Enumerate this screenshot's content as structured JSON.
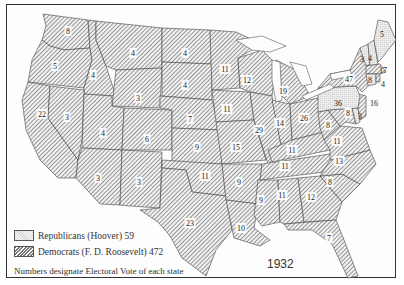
{
  "map": {
    "title_year": "1932",
    "note": "Numbers designate Electoral Vote of each state",
    "colors": {
      "republican_fill": "#e6e6e6",
      "democrat_hatch": "#777777",
      "border": "#333333",
      "background": "#ffffff"
    },
    "legend": [
      {
        "party": "Republican",
        "label": "Republicans (Hoover) 59",
        "pattern": "light-stipple"
      },
      {
        "party": "Democrat",
        "label": "Democrats (F. D. Roosevelt) 472",
        "pattern": "diagonal-hatch"
      }
    ],
    "states": [
      {
        "name": "Washington",
        "votes": "8",
        "party": "D"
      },
      {
        "name": "Oregon",
        "votes": "5",
        "party": "D"
      },
      {
        "name": "California",
        "votes": "22",
        "party": "D"
      },
      {
        "name": "Idaho",
        "votes": "4",
        "party": "D"
      },
      {
        "name": "Nevada",
        "votes": "3",
        "party": "D"
      },
      {
        "name": "Montana",
        "votes": "4",
        "party": "D"
      },
      {
        "name": "Wyoming",
        "votes": "3",
        "party": "D"
      },
      {
        "name": "Utah",
        "votes": "4",
        "party": "D"
      },
      {
        "name": "Arizona",
        "votes": "3",
        "party": "D"
      },
      {
        "name": "Colorado",
        "votes": "6",
        "party": "D"
      },
      {
        "name": "New Mexico",
        "votes": "3",
        "party": "D"
      },
      {
        "name": "North Dakota",
        "votes": "4",
        "party": "D"
      },
      {
        "name": "South Dakota",
        "votes": "4",
        "party": "D"
      },
      {
        "name": "Nebraska",
        "votes": "7",
        "party": "D"
      },
      {
        "name": "Kansas",
        "votes": "9",
        "party": "D"
      },
      {
        "name": "Oklahoma",
        "votes": "11",
        "party": "D"
      },
      {
        "name": "Texas",
        "votes": "23",
        "party": "D"
      },
      {
        "name": "Minnesota",
        "votes": "11",
        "party": "D"
      },
      {
        "name": "Iowa",
        "votes": "11",
        "party": "D"
      },
      {
        "name": "Missouri",
        "votes": "15",
        "party": "D"
      },
      {
        "name": "Arkansas",
        "votes": "9",
        "party": "D"
      },
      {
        "name": "Louisiana",
        "votes": "10",
        "party": "D"
      },
      {
        "name": "Wisconsin",
        "votes": "12",
        "party": "D"
      },
      {
        "name": "Illinois",
        "votes": "29",
        "party": "D"
      },
      {
        "name": "Michigan",
        "votes": "19",
        "party": "D"
      },
      {
        "name": "Indiana",
        "votes": "14",
        "party": "D"
      },
      {
        "name": "Ohio",
        "votes": "26",
        "party": "D"
      },
      {
        "name": "Kentucky",
        "votes": "11",
        "party": "D"
      },
      {
        "name": "Tennessee",
        "votes": "11",
        "party": "D"
      },
      {
        "name": "Mississippi",
        "votes": "9",
        "party": "D"
      },
      {
        "name": "Alabama",
        "votes": "11",
        "party": "D"
      },
      {
        "name": "Georgia",
        "votes": "12",
        "party": "D"
      },
      {
        "name": "Florida",
        "votes": "7",
        "party": "D"
      },
      {
        "name": "South Carolina",
        "votes": "8",
        "party": "D"
      },
      {
        "name": "North Carolina",
        "votes": "13",
        "party": "D"
      },
      {
        "name": "Virginia",
        "votes": "11",
        "party": "D"
      },
      {
        "name": "West Virginia",
        "votes": "8",
        "party": "D"
      },
      {
        "name": "Maryland",
        "votes": "8",
        "party": "D"
      },
      {
        "name": "Delaware",
        "votes": "3",
        "party": "R"
      },
      {
        "name": "New Jersey",
        "votes": "16",
        "party": "D"
      },
      {
        "name": "Pennsylvania",
        "votes": "36",
        "party": "R"
      },
      {
        "name": "New York",
        "votes": "47",
        "party": "D"
      },
      {
        "name": "Vermont",
        "votes": "3",
        "party": "R"
      },
      {
        "name": "New Hampshire",
        "votes": "4",
        "party": "R"
      },
      {
        "name": "Maine",
        "votes": "5",
        "party": "R"
      },
      {
        "name": "Massachusetts",
        "votes": "17",
        "party": "D"
      },
      {
        "name": "Connecticut",
        "votes": "8",
        "party": "R"
      },
      {
        "name": "Rhode Island",
        "votes": "4",
        "party": "D"
      }
    ]
  }
}
